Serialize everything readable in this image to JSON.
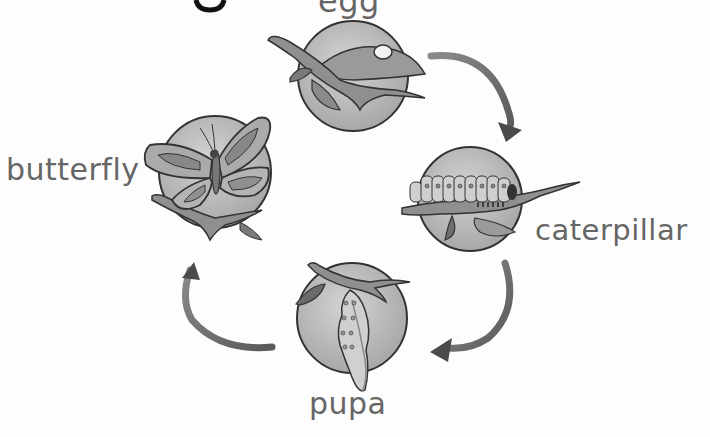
{
  "diagram": {
    "type": "life-cycle",
    "subject": "butterfly",
    "stages": [
      {
        "id": "egg",
        "label": "egg",
        "order": 1
      },
      {
        "id": "caterpillar",
        "label": "caterpillar",
        "order": 2
      },
      {
        "id": "pupa",
        "label": "pupa",
        "order": 3
      },
      {
        "id": "butterfly",
        "label": "butterfly",
        "order": 4
      }
    ],
    "arrows": [
      {
        "from": "egg",
        "to": "caterpillar"
      },
      {
        "from": "caterpillar",
        "to": "pupa"
      },
      {
        "from": "pupa",
        "to": "butterfly"
      }
    ],
    "colors": {
      "label": "#666666",
      "circle": "#b8b8b8",
      "arrow": "#6e6e6e",
      "outline": "#333333"
    }
  }
}
